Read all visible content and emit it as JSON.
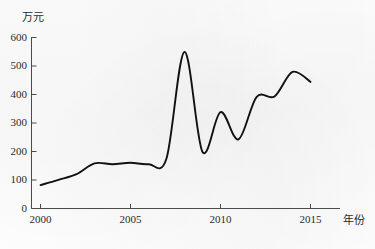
{
  "chart_data": {
    "type": "line",
    "title": "",
    "subtitle": "",
    "xlabel": "年份",
    "ylabel": "万元",
    "xlim": [
      2000,
      2016
    ],
    "ylim": [
      0,
      600
    ],
    "grid": false,
    "legend": null,
    "x_ticks": [
      "2000",
      "2005",
      "2010",
      "2015"
    ],
    "x_tick_values": [
      2000,
      2005,
      2010,
      2015
    ],
    "y_ticks": [
      "0",
      "100",
      "200",
      "300",
      "400",
      "500",
      "600"
    ],
    "y_tick_values": [
      0,
      100,
      200,
      300,
      400,
      500,
      600
    ],
    "series": [
      {
        "name": "",
        "color": "#111111",
        "x": [
          2000,
          2001,
          2002,
          2003,
          2004,
          2005,
          2006,
          2007,
          2008,
          2009,
          2010,
          2011,
          2012,
          2013,
          2014,
          2015
        ],
        "values": [
          82,
          100,
          120,
          158,
          155,
          160,
          155,
          175,
          548,
          198,
          337,
          242,
          390,
          392,
          478,
          443
        ]
      }
    ],
    "annotations": []
  },
  "axis": {
    "y_axis_title": "万元",
    "x_axis_title": "年份"
  }
}
